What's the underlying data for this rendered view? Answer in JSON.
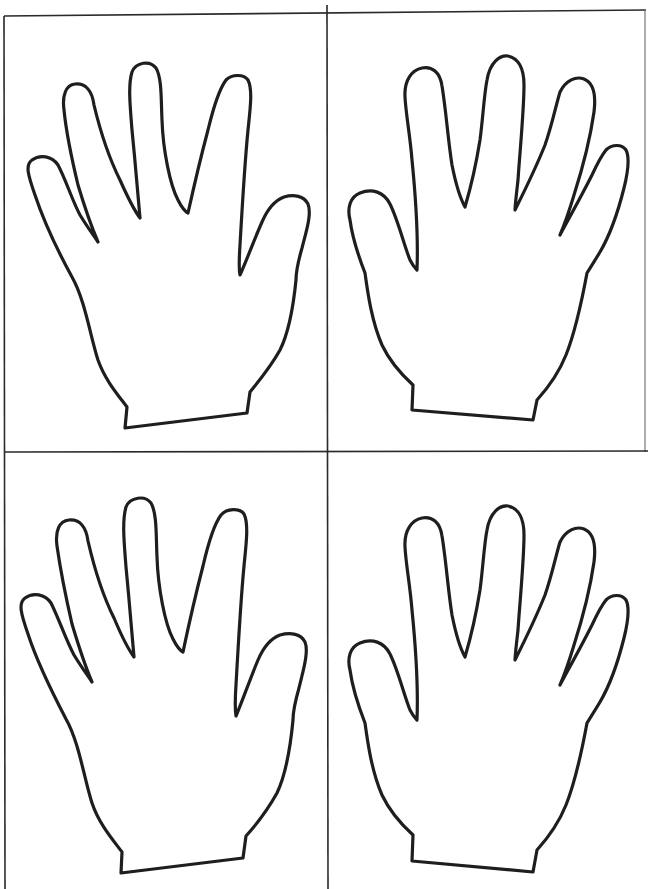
{
  "sheet": {
    "description": "Printable worksheet with four blank hand outlines in a 2x2 grid",
    "background_color": "#ffffff",
    "line_color": "#1e1e1e",
    "grid": {
      "rows": 2,
      "columns": 2,
      "vertical_divider_x": 327,
      "horizontal_divider_y": 452
    },
    "cells": [
      {
        "position": "top-left",
        "content": "left hand outline (palm view, thumb on right)"
      },
      {
        "position": "top-right",
        "content": "right hand outline (palm view, thumb on left)"
      },
      {
        "position": "bottom-left",
        "content": "left hand outline (palm view, thumb on right)"
      },
      {
        "position": "bottom-right",
        "content": "right hand outline (palm view, thumb on left)"
      }
    ]
  }
}
